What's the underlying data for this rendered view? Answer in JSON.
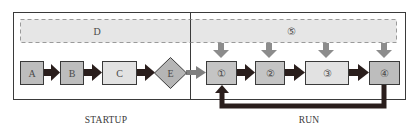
{
  "diagram": {
    "phases": [
      {
        "id": "startup",
        "label": "STARTUP"
      },
      {
        "id": "run",
        "label": "RUN"
      }
    ],
    "startup": {
      "shared_block": {
        "label": "D"
      },
      "nodes": [
        {
          "id": "A",
          "label": "A",
          "shape": "square"
        },
        {
          "id": "B",
          "label": "B",
          "shape": "square"
        },
        {
          "id": "C",
          "label": "C",
          "shape": "rectangle"
        },
        {
          "id": "E",
          "label": "E",
          "shape": "diamond"
        }
      ]
    },
    "run": {
      "shared_block": {
        "label": "⑤"
      },
      "nodes": [
        {
          "id": "1",
          "label": "①",
          "shape": "square"
        },
        {
          "id": "2",
          "label": "②",
          "shape": "square"
        },
        {
          "id": "3",
          "label": "③",
          "shape": "rectangle"
        },
        {
          "id": "4",
          "label": "④",
          "shape": "square"
        }
      ]
    },
    "edges": [
      {
        "from": "A",
        "to": "B",
        "style": "thick-dark"
      },
      {
        "from": "B",
        "to": "C",
        "style": "thick-dark"
      },
      {
        "from": "C",
        "to": "E",
        "style": "thick-dark"
      },
      {
        "from": "E",
        "to": "1",
        "style": "gray"
      },
      {
        "from": "1",
        "to": "2",
        "style": "thick-dark"
      },
      {
        "from": "2",
        "to": "3",
        "style": "thick-dark"
      },
      {
        "from": "3",
        "to": "4",
        "style": "thick-dark"
      },
      {
        "from": "4",
        "to": "1",
        "style": "thick-dark-loop"
      },
      {
        "from": "5",
        "to": "1",
        "style": "gray-down"
      },
      {
        "from": "5",
        "to": "2",
        "style": "gray-down"
      },
      {
        "from": "5",
        "to": "3",
        "style": "gray-down"
      },
      {
        "from": "5",
        "to": "4",
        "style": "gray-down"
      }
    ],
    "colors": {
      "frame": "#3a3a3a",
      "dark_arrow": "#2a1e1c",
      "gray_arrow": "#8c8c8c",
      "node_dark_fill": "#bdbdbd",
      "node_light_fill": "#e2e2e2",
      "dashed_fill": "#e6e6e6",
      "dashed_stroke": "#9a9a9a"
    }
  }
}
